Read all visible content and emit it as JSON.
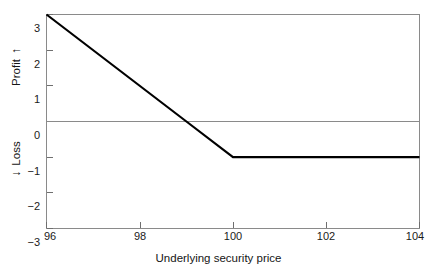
{
  "chart_data": {
    "type": "line",
    "title": "",
    "subtitle": "",
    "xlabel": "Underlying security price",
    "ylabel": "Profit / Loss",
    "ylabel_upper": "Profit",
    "ylabel_lower": "Loss",
    "ylabel_upper_arrow": "↑",
    "ylabel_lower_arrow": "↓",
    "xlim": [
      96,
      104
    ],
    "ylim": [
      -3,
      3
    ],
    "xticks": [
      96,
      98,
      100,
      102,
      104
    ],
    "xtick_labels": [
      "96",
      "98",
      "100",
      "102",
      "104"
    ],
    "yticks": [
      3,
      2,
      1,
      0,
      -1,
      -2,
      -3
    ],
    "ytick_labels": [
      "3",
      "2",
      "1",
      "0",
      "−1",
      "−2",
      "−3"
    ],
    "grid": false,
    "legend": null,
    "zero_line": true,
    "series": [
      {
        "name": "Profit/loss at expiration",
        "x": [
          96,
          99,
          100,
          104
        ],
        "values": [
          3,
          0,
          -1,
          -1
        ],
        "color": "#000000",
        "linewidth": 2.2
      }
    ],
    "annotations": [
      {
        "text": "breakeven at 99",
        "x": 99,
        "y": 0
      },
      {
        "text": "kink at strike 100, floor -1",
        "x": 100,
        "y": -1
      }
    ]
  },
  "axis_style": {
    "frame_color": "#8a8a8a",
    "zero_line_color": "#8a8a8a",
    "tick_color": "#6f6f6f",
    "data_color": "#111111",
    "background": "#ffffff"
  }
}
